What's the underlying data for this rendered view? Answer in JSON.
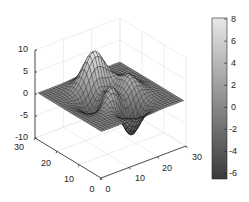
{
  "chart_data": {
    "type": "surface",
    "title": "",
    "function": "peaks",
    "xlabel": "",
    "ylabel": "",
    "zlabel": "",
    "xlim": [
      0,
      30
    ],
    "ylim": [
      0,
      30
    ],
    "zlim": [
      -10,
      10
    ],
    "x_ticks": [
      0,
      10,
      20,
      30
    ],
    "y_ticks": [
      0,
      10,
      20,
      30
    ],
    "z_ticks": [
      -10,
      -5,
      0,
      5,
      10
    ],
    "grid": true,
    "grid_size": 30,
    "colormap": "gray",
    "colorbar": {
      "position": "right",
      "range": [
        -6.5,
        8.1
      ],
      "ticks": [
        8,
        6,
        4,
        2,
        0,
        -2,
        -4,
        -6
      ]
    },
    "z_range_of_data": [
      -6.55,
      8.1
    ],
    "features": [
      "main peak ~8 near back-left",
      "secondary peak ~3.6 center-right",
      "deep trough ~-6.5 toward front-right"
    ]
  },
  "labels": {
    "z_ticks": [
      "10",
      "5",
      "0",
      "-5",
      "-10"
    ],
    "y_ticks": [
      "30",
      "20",
      "10",
      "0"
    ],
    "x_ticks": [
      "0",
      "10",
      "20",
      "30"
    ],
    "colorbar_ticks": [
      "8",
      "6",
      "4",
      "2",
      "0",
      "-2",
      "-4",
      "-6"
    ]
  },
  "colors": {
    "axis": "#262626",
    "grid": "#e6e6e6",
    "edge": "#000000",
    "background": "#ffffff"
  }
}
